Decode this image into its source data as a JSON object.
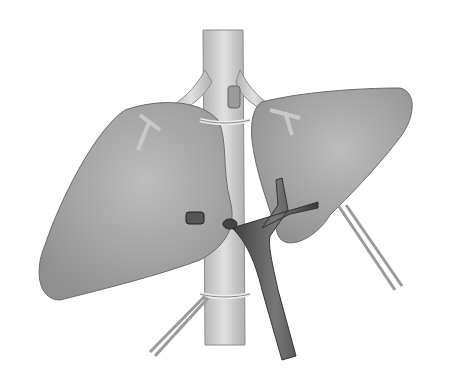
{
  "figure": {
    "type": "anatomical-illustration",
    "colors": {
      "background": "#ffffff",
      "liver": "#a9a9a9",
      "liver_shadow": "#8a8a8a",
      "vessel": "#cfcfcf",
      "portal_vein": "#555555",
      "outline": "#6b6b6b"
    }
  }
}
